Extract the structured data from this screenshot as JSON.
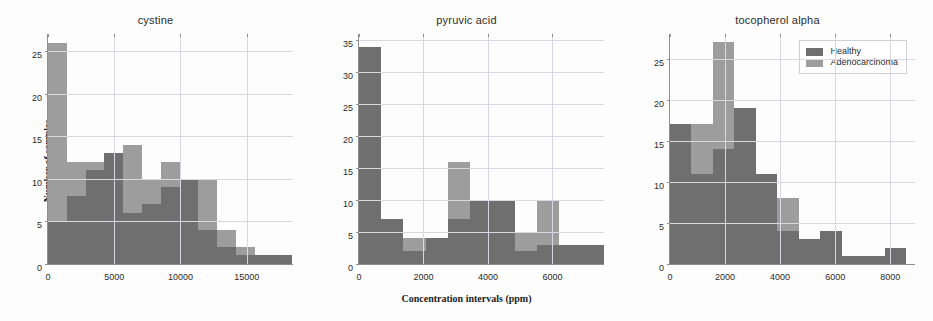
{
  "figure": {
    "xlabel": "Concentration intervals  (ppm)",
    "ylabel": "Number of samples",
    "legend": {
      "position": "upper-right-of-third-panel",
      "entries": [
        {
          "label": "Healthy",
          "color": "#6f6f6f"
        },
        {
          "label": "Adenocarcinoma",
          "color": "#9d9d9d"
        }
      ]
    }
  },
  "chart_data": [
    {
      "type": "bar",
      "title": "cystine",
      "xlabel": "",
      "ylabel": "Number of samples",
      "xlim": [
        0,
        18500
      ],
      "ylim": [
        0,
        27
      ],
      "xticks": [
        0,
        5000,
        10000,
        15000
      ],
      "yticks": [
        0,
        5,
        10,
        15,
        20,
        25
      ],
      "grid": true,
      "bin_width": 1420,
      "bin_starts": [
        0,
        1420,
        2840,
        4260,
        5680,
        7100,
        8520,
        9940,
        11360,
        12780,
        14200,
        15620,
        17040
      ],
      "series": [
        {
          "name": "Adenocarcinoma",
          "color": "#9d9d9d",
          "values": [
            26,
            12,
            12,
            13,
            14,
            10,
            12,
            9,
            10,
            4,
            2,
            1,
            1
          ]
        },
        {
          "name": "Healthy",
          "color": "#6f6f6f",
          "values": [
            5,
            8,
            11,
            13,
            6,
            7,
            9,
            10,
            4,
            2,
            1,
            1,
            1
          ]
        }
      ]
    },
    {
      "type": "bar",
      "title": "pyruvic acid",
      "xlabel": "Concentration intervals  (ppm)",
      "ylabel": "",
      "xlim": [
        0,
        7600
      ],
      "ylim": [
        0,
        36
      ],
      "xticks": [
        0,
        2000,
        4000,
        6000,
        8000
      ],
      "yticks": [
        0,
        5,
        10,
        15,
        20,
        25,
        30,
        35
      ],
      "grid": true,
      "bin_width": 690,
      "bin_starts": [
        0,
        690,
        1380,
        2070,
        2760,
        3450,
        4140,
        4830,
        5520,
        6210,
        6900
      ],
      "series": [
        {
          "name": "Adenocarcinoma",
          "color": "#9d9d9d",
          "values": [
            32,
            2,
            4,
            4,
            16,
            9,
            10,
            5,
            10,
            3,
            3
          ]
        },
        {
          "name": "Healthy",
          "color": "#6f6f6f",
          "values": [
            34,
            7,
            2,
            4,
            7,
            10,
            10,
            2,
            3,
            3,
            3
          ]
        }
      ]
    },
    {
      "type": "bar",
      "title": "tocopherol alpha",
      "xlabel": "",
      "ylabel": "",
      "xlim": [
        0,
        8900
      ],
      "ylim": [
        0,
        28
      ],
      "xticks": [
        0,
        2000,
        4000,
        6000,
        8000
      ],
      "yticks": [
        0,
        5,
        10,
        15,
        20,
        25
      ],
      "grid": true,
      "bin_width": 780,
      "bin_starts": [
        0,
        780,
        1560,
        2340,
        3120,
        3900,
        4680,
        5460,
        6240,
        7020,
        7800
      ],
      "series": [
        {
          "name": "Adenocarcinoma",
          "color": "#9d9d9d",
          "values": [
            17,
            17,
            27,
            11,
            11,
            8,
            1,
            1,
            1,
            0,
            0
          ]
        },
        {
          "name": "Healthy",
          "color": "#6f6f6f",
          "values": [
            17,
            11,
            14,
            19,
            11,
            4,
            3,
            4,
            1,
            1,
            2
          ]
        }
      ]
    }
  ]
}
